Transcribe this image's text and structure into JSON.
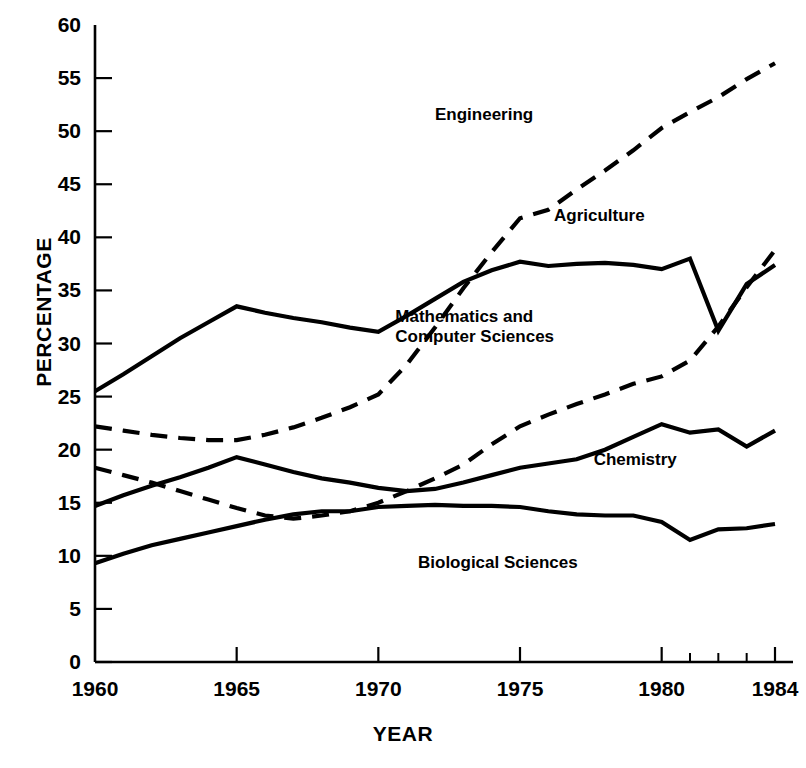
{
  "chart_data": {
    "type": "line",
    "title": "",
    "xlabel": "YEAR",
    "ylabel": "PERCENTAGE",
    "xlim": [
      1960,
      1984
    ],
    "ylim": [
      0,
      60
    ],
    "grid": false,
    "legend_position": "inline-labels",
    "x_ticks": [
      "1960",
      "1965",
      "1970",
      "1975",
      "1980",
      "1984"
    ],
    "x_tick_values": [
      1960,
      1965,
      1970,
      1975,
      1980,
      1984
    ],
    "x_minor_tick_values": [
      1981,
      1982,
      1983
    ],
    "y_ticks": [
      "0",
      "5",
      "10",
      "15",
      "20",
      "25",
      "30",
      "35",
      "40",
      "45",
      "50",
      "55",
      "60"
    ],
    "y_tick_values": [
      0,
      5,
      10,
      15,
      20,
      25,
      30,
      35,
      40,
      45,
      50,
      55,
      60
    ],
    "x": [
      1960,
      1961,
      1962,
      1963,
      1964,
      1965,
      1966,
      1967,
      1968,
      1969,
      1970,
      1971,
      1972,
      1973,
      1974,
      1975,
      1976,
      1977,
      1978,
      1979,
      1980,
      1981,
      1982,
      1983,
      1984
    ],
    "series": [
      {
        "name": "Agriculture",
        "style": "solid",
        "label_x": 1976.2,
        "label_y": 42.0,
        "values": [
          25.5,
          27.1,
          28.8,
          30.5,
          32.0,
          33.5,
          32.9,
          32.4,
          32.0,
          31.5,
          31.1,
          32.6,
          34.2,
          35.8,
          36.9,
          37.7,
          37.3,
          37.5,
          37.6,
          37.4,
          37.0,
          38.0,
          31.2,
          35.6,
          37.4
        ]
      },
      {
        "name": "Engineering",
        "style": "dashed",
        "label_x": 1972.0,
        "label_y": 51.5,
        "values": [
          22.2,
          21.8,
          21.4,
          21.1,
          20.9,
          20.9,
          21.4,
          22.1,
          23.0,
          24.0,
          25.2,
          28.0,
          31.5,
          35.2,
          38.6,
          41.8,
          42.6,
          44.5,
          46.3,
          48.2,
          50.3,
          51.8,
          53.2,
          54.9,
          56.4
        ]
      },
      {
        "name": "Mathematics and\nComputer Sciences",
        "name_line1": "Mathematics and",
        "name_line2": "Computer Sciences",
        "style": "dashed",
        "label_x": 1970.6,
        "label_y": 32.5,
        "values": [
          18.3,
          17.6,
          16.9,
          16.1,
          15.3,
          14.5,
          13.8,
          13.5,
          13.8,
          14.2,
          15.0,
          16.1,
          17.3,
          18.6,
          20.5,
          22.2,
          23.3,
          24.3,
          25.2,
          26.2,
          26.9,
          28.4,
          31.6,
          35.3,
          38.8
        ]
      },
      {
        "name": "Chemistry",
        "style": "solid",
        "label_x": 1977.6,
        "label_y": 19.0,
        "values": [
          14.7,
          15.7,
          16.6,
          17.4,
          18.3,
          19.3,
          18.6,
          17.9,
          17.3,
          16.9,
          16.4,
          16.1,
          16.3,
          16.9,
          17.6,
          18.3,
          18.7,
          19.1,
          20.0,
          21.2,
          22.4,
          21.6,
          21.9,
          20.3,
          21.8
        ]
      },
      {
        "name": "Biological Sciences",
        "style": "solid",
        "label_x": 1971.4,
        "label_y": 9.3,
        "values": [
          9.3,
          10.2,
          11.0,
          11.6,
          12.2,
          12.8,
          13.4,
          13.9,
          14.2,
          14.2,
          14.6,
          14.7,
          14.8,
          14.7,
          14.7,
          14.6,
          14.2,
          13.9,
          13.8,
          13.8,
          13.2,
          11.5,
          12.5,
          12.6,
          13.0
        ]
      }
    ]
  }
}
